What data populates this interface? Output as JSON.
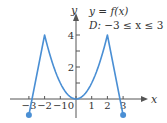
{
  "chart_data": {
    "type": "line",
    "title": "y = f(x)",
    "subtitle": "D: −3 ≤ x ≤ 3",
    "xlabel": "x",
    "ylabel": "y",
    "xlim": [
      -3.2,
      3.8
    ],
    "ylim": [
      -1.2,
      5
    ],
    "x_ticks": [
      -3,
      -2,
      -1,
      0,
      1,
      2,
      3
    ],
    "x_tick_labels": [
      "−3",
      "−2",
      "−1",
      "0",
      "1",
      "2",
      "3"
    ],
    "y_ticks": [
      1,
      2,
      3,
      4
    ],
    "y_tick_labels": [
      "",
      "2",
      "",
      "4"
    ],
    "grid": false,
    "series": [
      {
        "name": "f(x)",
        "color": "#4a8fd4",
        "points": [
          [
            -3,
            -1
          ],
          [
            -2,
            4
          ],
          [
            -1.5,
            2.25
          ],
          [
            -1,
            1
          ],
          [
            -0.5,
            0.25
          ],
          [
            0,
            0
          ],
          [
            0.5,
            0.25
          ],
          [
            1,
            1
          ],
          [
            1.5,
            2.25
          ],
          [
            2,
            4
          ],
          [
            3,
            -1
          ]
        ],
        "endpoints": [
          [
            -3,
            -1
          ],
          [
            3,
            -1
          ]
        ],
        "endpoint_style": "closed-dot"
      }
    ]
  },
  "labels": {
    "title": "y = f(x)",
    "domain_prefix": "D: ",
    "domain_text": "−3 ≤ x ≤ 3",
    "x_axis": "x",
    "y_axis": "y"
  }
}
